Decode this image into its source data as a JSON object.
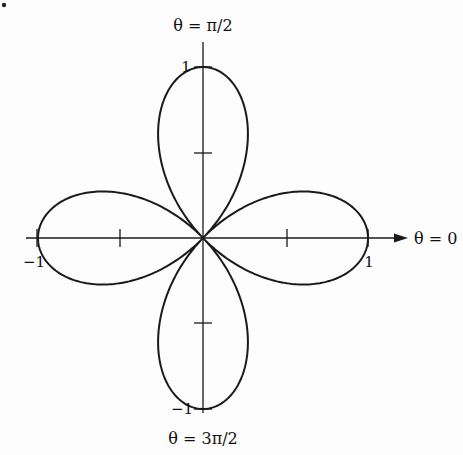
{
  "diagram": {
    "type": "polar-rose",
    "equation_shape": "four-leaved rose r = cos(2θ)",
    "labels": {
      "top": "θ = π/2",
      "bottom": "θ = 3π/2",
      "right": "θ = 0",
      "x_pos": "1",
      "x_neg": "−1",
      "y_pos": "1",
      "y_neg": "−1"
    },
    "bullet": "•",
    "colors": {
      "stroke": "#1a1a1a",
      "background": "#fdfdfd"
    }
  }
}
